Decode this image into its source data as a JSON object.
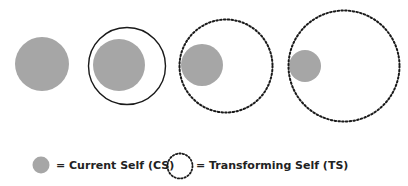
{
  "diagram": {
    "colors": {
      "current_self_fill": "#a6a6a6",
      "ring_stroke": "#1a1a1a",
      "background": "#ffffff"
    },
    "stages": [
      {
        "name": "stage-1",
        "outer": null,
        "inner": {
          "cx": 42,
          "cy": 64,
          "r": 27
        }
      },
      {
        "name": "stage-2",
        "outer": {
          "cx": 127,
          "cy": 66,
          "r": 39,
          "style": "solid"
        },
        "inner": {
          "cx": 119,
          "cy": 65,
          "r": 26
        }
      },
      {
        "name": "stage-3",
        "outer": {
          "cx": 226,
          "cy": 66,
          "r": 47,
          "style": "dotted"
        },
        "inner": {
          "cx": 202,
          "cy": 65,
          "r": 21
        }
      },
      {
        "name": "stage-4",
        "outer": {
          "cx": 344,
          "cy": 66,
          "r": 56,
          "style": "dotted"
        },
        "inner": {
          "cx": 305,
          "cy": 66,
          "r": 16
        }
      }
    ]
  },
  "legend": {
    "current_self": {
      "label": "= Current Self (CS)",
      "symbol": "filled-gray-circle"
    },
    "transforming_self": {
      "label": "= Transforming Self (TS)",
      "symbol": "dotted-circle"
    }
  }
}
